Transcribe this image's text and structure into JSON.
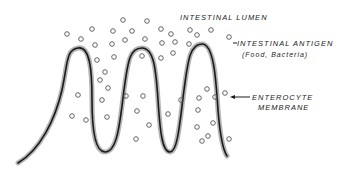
{
  "labels": {
    "lumen": "INTESTINAL LUMEN",
    "antigen": "INTESTINAL ANTIGEN",
    "antigen_sub": "(Food, Bacteria)",
    "membrane_line1": "ENTEROCYTE",
    "membrane_line2": "MEMBRANE"
  },
  "colors": {
    "line": "#1a1a1a",
    "shade": "#9a9a9a",
    "circle": "#555555"
  },
  "antigens": [
    [
      67,
      34
    ],
    [
      81,
      39
    ],
    [
      92,
      29
    ],
    [
      113,
      31
    ],
    [
      123,
      20
    ],
    [
      132,
      31
    ],
    [
      147,
      21
    ],
    [
      161,
      29
    ],
    [
      95,
      45
    ],
    [
      112,
      44
    ],
    [
      125,
      40
    ],
    [
      145,
      39
    ],
    [
      162,
      43
    ],
    [
      97,
      60
    ],
    [
      114,
      57
    ],
    [
      142,
      56
    ],
    [
      161,
      58
    ],
    [
      105,
      72
    ],
    [
      190,
      30
    ],
    [
      197,
      35
    ],
    [
      211,
      30
    ],
    [
      229,
      37
    ],
    [
      171,
      34
    ],
    [
      175,
      42
    ],
    [
      173,
      53
    ],
    [
      189,
      44
    ],
    [
      78,
      95
    ],
    [
      72,
      116
    ],
    [
      86,
      120
    ],
    [
      100,
      80
    ],
    [
      108,
      88
    ],
    [
      102,
      100
    ],
    [
      107,
      117
    ],
    [
      126,
      96
    ],
    [
      143,
      96
    ],
    [
      137,
      111
    ],
    [
      149,
      125
    ],
    [
      136,
      139
    ],
    [
      181,
      100
    ],
    [
      199,
      98
    ],
    [
      198,
      110
    ],
    [
      207,
      89
    ],
    [
      215,
      97
    ],
    [
      225,
      93
    ],
    [
      197,
      127
    ],
    [
      208,
      136
    ],
    [
      213,
      123
    ],
    [
      229,
      139
    ],
    [
      202,
      141
    ],
    [
      168,
      114
    ]
  ]
}
